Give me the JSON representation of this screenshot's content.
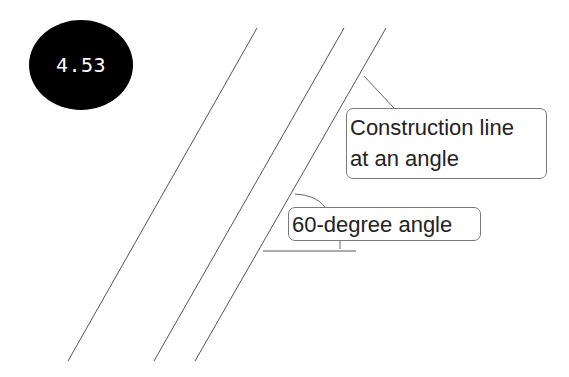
{
  "figure": {
    "number_badge": "4.53"
  },
  "callouts": {
    "construction_line": {
      "lines": [
        "Construction line",
        "at an angle"
      ]
    },
    "angle": {
      "text": "60-degree angle"
    }
  },
  "colors": {
    "line": "#555555",
    "badge_bg": "#000000",
    "badge_text": "#ffffff",
    "callout_border": "#7a7a7a"
  }
}
